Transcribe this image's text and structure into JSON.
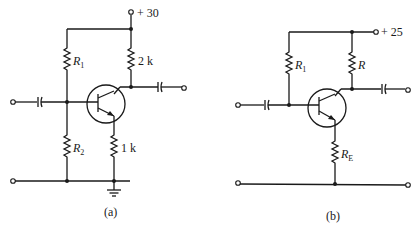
{
  "circuits": [
    {
      "id": "a",
      "caption": "(a)",
      "supply_label": "+ 30",
      "resistors": {
        "r1": {
          "name": "R",
          "sub": "1"
        },
        "r2": {
          "name": "R",
          "sub": "2"
        },
        "rc": {
          "value": "2 k"
        },
        "re": {
          "value": "1 k"
        }
      },
      "has_ground": true
    },
    {
      "id": "b",
      "caption": "(b)",
      "supply_label": "+ 25",
      "resistors": {
        "r1": {
          "name": "R",
          "sub": "1"
        },
        "rc": {
          "name": "R",
          "sub": ""
        },
        "re": {
          "name": "R",
          "sub": "E"
        }
      },
      "has_ground": false
    }
  ]
}
